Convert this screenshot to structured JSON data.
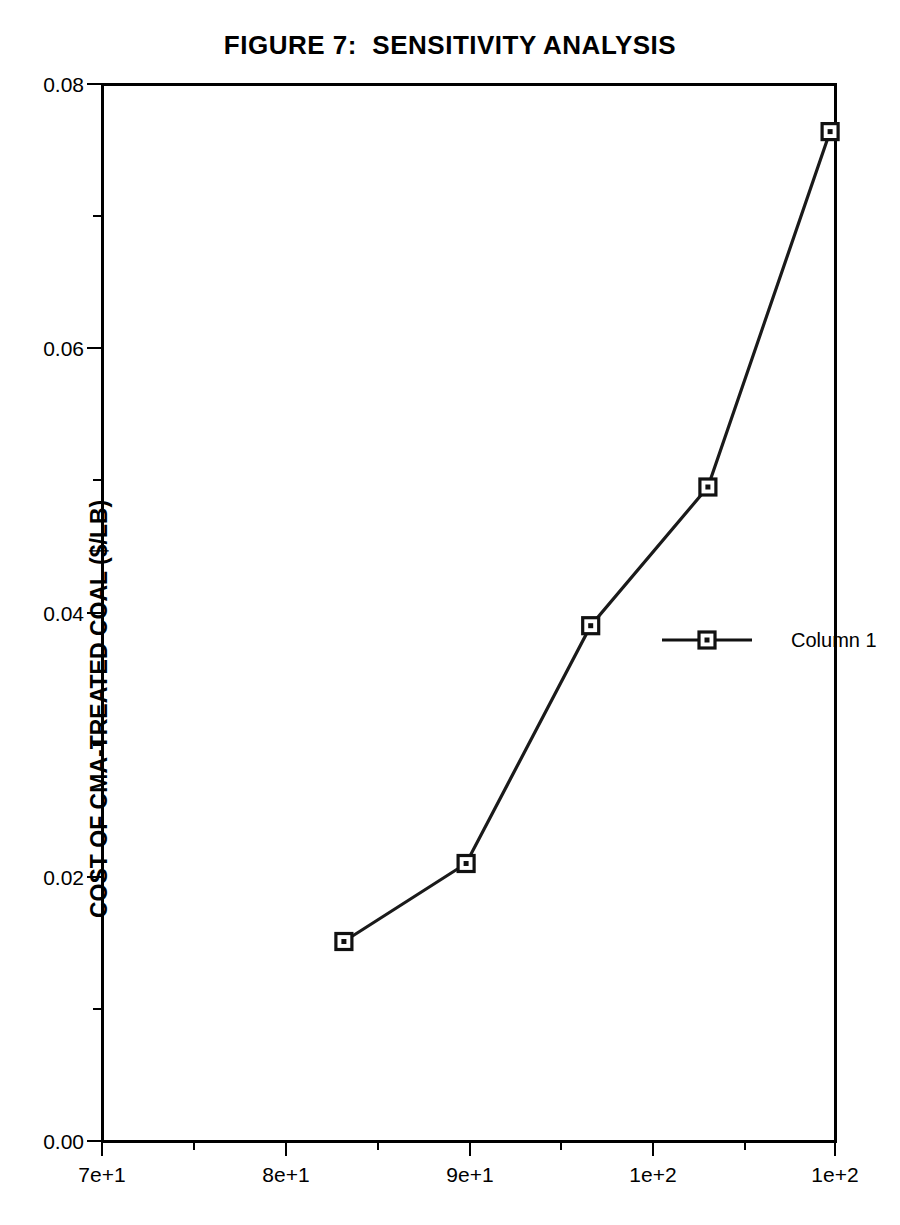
{
  "figure": {
    "title": "FIGURE 7:  SENSITIVITY ANALYSIS",
    "background_color": "#ffffff",
    "ink_color": "#000000"
  },
  "chart_data": {
    "type": "line",
    "title": "FIGURE 7:  SENSITIVITY ANALYSIS",
    "xlabel": "",
    "ylabel": "COST OF CMA-TREATED COAL ($/LB)",
    "xlim": [
      70,
      100
    ],
    "ylim": [
      0.0,
      0.08
    ],
    "grid": false,
    "legend_position": "right-middle",
    "x_tick_labels": [
      "7e+1",
      "8e+1",
      "9e+1",
      "1e+2",
      "1e+2"
    ],
    "x_tick_values": [
      70,
      80,
      90,
      100,
      100
    ],
    "x_minor_tick_count": 9,
    "y_tick_labels": [
      "0.00",
      "0.02",
      "0.04",
      "0.06",
      "0.08"
    ],
    "y_tick_values": [
      0.0,
      0.02,
      0.04,
      0.06,
      0.08
    ],
    "series": [
      {
        "name": "Column 1",
        "marker": "square",
        "x": [
          79.9,
          84.9,
          90.0,
          94.8,
          99.8
        ],
        "values": [
          0.0151,
          0.021,
          0.039,
          0.0495,
          0.0764
        ]
      }
    ]
  },
  "legend": {
    "entries": [
      {
        "label": "Column 1"
      }
    ]
  },
  "axes": {
    "y_title": "COST OF CMA-TREATED COAL ($/LB)",
    "y_ticks": [
      {
        "label": "0.08"
      },
      {
        "label": "0.06"
      },
      {
        "label": "0.04"
      },
      {
        "label": "0.02"
      },
      {
        "label": "0.00"
      }
    ],
    "x_ticks": [
      {
        "label": "7e+1"
      },
      {
        "label": "8e+1"
      },
      {
        "label": "9e+1"
      },
      {
        "label": "1e+2"
      },
      {
        "label": "1e+2"
      }
    ]
  }
}
